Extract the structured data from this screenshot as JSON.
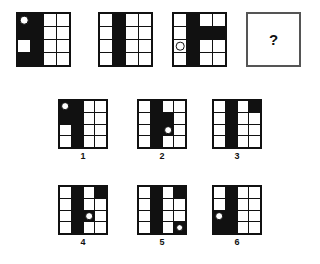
{
  "puzzle": {
    "type": "matrix-reasoning",
    "grid_size": 4,
    "question_mark": "?",
    "colors": {
      "fill": "#111111",
      "background": "#ffffff",
      "border": "#555555"
    },
    "matrix": [
      {
        "name": "matrix-cell-1",
        "filled": [
          "r1c1",
          "r1c2",
          "r2c1",
          "r2c2",
          "r3c2",
          "r4c1",
          "r4c2"
        ],
        "circles": [
          "r1c1"
        ]
      },
      {
        "name": "matrix-cell-2",
        "filled": [
          "r1c2",
          "r2c2",
          "r3c2",
          "r4c2"
        ],
        "circles": []
      },
      {
        "name": "matrix-cell-3",
        "filled": [
          "r1c2",
          "r2c2",
          "r2c3",
          "r2c4",
          "r3c2",
          "r4c2"
        ],
        "circles": [
          "r3c1"
        ]
      }
    ],
    "options": [
      {
        "label": "1",
        "name": "option-1",
        "filled": [
          "r1c1",
          "r1c2",
          "r2c1",
          "r2c2",
          "r3c2",
          "r4c2"
        ],
        "circles": [
          "r1c1"
        ]
      },
      {
        "label": "2",
        "name": "option-2",
        "filled": [
          "r1c2",
          "r2c2",
          "r2c3",
          "r3c2",
          "r3c3",
          "r4c2"
        ],
        "circles": [
          "r3c3"
        ]
      },
      {
        "label": "3",
        "name": "option-3",
        "filled": [
          "r1c2",
          "r1c4",
          "r2c2",
          "r3c2",
          "r4c2"
        ],
        "circles": []
      },
      {
        "label": "4",
        "name": "option-4",
        "filled": [
          "r1c2",
          "r1c4",
          "r2c2",
          "r3c2",
          "r3c3",
          "r4c2"
        ],
        "circles": [
          "r3c3"
        ]
      },
      {
        "label": "5",
        "name": "option-5",
        "filled": [
          "r1c2",
          "r1c4",
          "r2c2",
          "r3c2",
          "r4c2",
          "r4c4"
        ],
        "circles": [
          "r4c4"
        ]
      },
      {
        "label": "6",
        "name": "option-6",
        "filled": [
          "r1c2",
          "r2c2",
          "r3c1",
          "r3c2",
          "r4c1",
          "r4c2"
        ],
        "circles": [
          "r3c1"
        ]
      }
    ]
  },
  "layout": {
    "matrix_panels": [
      {
        "x": 16,
        "y": 12,
        "w": 55,
        "h": 55
      },
      {
        "x": 98,
        "y": 12,
        "w": 55,
        "h": 55
      },
      {
        "x": 172,
        "y": 12,
        "w": 55,
        "h": 55
      }
    ],
    "question_panel": {
      "x": 246,
      "y": 12,
      "w": 55,
      "h": 55
    },
    "option_panels": [
      {
        "x": 58,
        "y": 99,
        "w": 50,
        "h": 50,
        "label_x": 83,
        "label_y": 152
      },
      {
        "x": 137,
        "y": 99,
        "w": 50,
        "h": 50,
        "label_x": 162,
        "label_y": 152
      },
      {
        "x": 212,
        "y": 99,
        "w": 50,
        "h": 50,
        "label_x": 237,
        "label_y": 152
      },
      {
        "x": 58,
        "y": 185,
        "w": 50,
        "h": 50,
        "label_x": 83,
        "label_y": 238
      },
      {
        "x": 137,
        "y": 185,
        "w": 50,
        "h": 50,
        "label_x": 162,
        "label_y": 238
      },
      {
        "x": 212,
        "y": 185,
        "w": 50,
        "h": 50,
        "label_x": 237,
        "label_y": 238
      }
    ]
  }
}
